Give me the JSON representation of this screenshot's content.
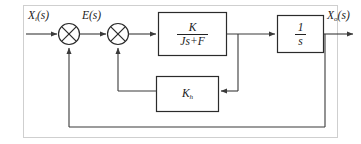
{
  "figure": {
    "type": "control-system-block-diagram",
    "background_color": "#ffffff",
    "line_color": "#3a3a3a",
    "text_color": "#1a1a1a",
    "frame": {
      "visible": true,
      "color": "#cfcfcf"
    }
  },
  "signals": {
    "input": {
      "base": "X",
      "subscript": "i",
      "argument": "(s)",
      "text": "Xi(s)"
    },
    "error": {
      "base": "E",
      "subscript": "",
      "argument": "(s)",
      "text": "E(s)"
    },
    "output": {
      "base": "X",
      "subscript": "o",
      "argument": "(s)",
      "text": "Xo(s)"
    }
  },
  "summing_junctions": [
    {
      "name": "sum1",
      "symbol": "cross-circle",
      "inputs": [
        "input",
        "outer-feedback"
      ]
    },
    {
      "name": "sum2",
      "symbol": "cross-circle",
      "inputs": [
        "error",
        "inner-feedback"
      ]
    }
  ],
  "blocks": [
    {
      "name": "plant",
      "kind": "transfer-function",
      "numerator": "K",
      "denominator": "Js+F",
      "text": "K / (Js+F)"
    },
    {
      "name": "integrator",
      "kind": "transfer-function",
      "numerator": "1",
      "denominator": "s",
      "text": "1 / s"
    },
    {
      "name": "tachometer-gain",
      "kind": "gain",
      "base": "K",
      "subscript": "h",
      "text": "Kh"
    }
  ],
  "paths": [
    {
      "name": "forward-path",
      "from": "input",
      "to": "output"
    },
    {
      "name": "inner-feedback-path",
      "from": "plant-output",
      "to": "sum2",
      "via": "tachometer-gain"
    },
    {
      "name": "outer-feedback-path",
      "from": "output",
      "to": "sum1"
    }
  ]
}
